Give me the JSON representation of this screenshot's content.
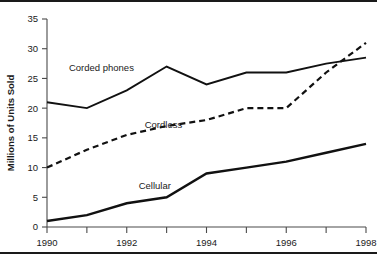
{
  "chart_data": {
    "type": "line",
    "title": "",
    "xlabel": "",
    "ylabel": "Millions of Units Sold",
    "xlim": [
      1990,
      1998
    ],
    "ylim": [
      0,
      35
    ],
    "grid": false,
    "legend_position": "inline-labels",
    "x": [
      1990,
      1991,
      1992,
      1993,
      1994,
      1995,
      1996,
      1997,
      1998
    ],
    "xtick_labels": [
      "1990",
      "1992",
      "1994",
      "1996",
      "1998"
    ],
    "xtick_values": [
      1990,
      1992,
      1994,
      1996,
      1998
    ],
    "xtick_minor_values": [
      1991,
      1993,
      1995,
      1997
    ],
    "ytick_labels": [
      "0",
      "5",
      "10",
      "15",
      "20",
      "25",
      "30",
      "35"
    ],
    "ytick_values": [
      0,
      5,
      10,
      15,
      20,
      25,
      30,
      35
    ],
    "series": [
      {
        "name": "Corded phones",
        "style": "solid",
        "label_x": 1990.55,
        "label_y": 26.2,
        "values": [
          21,
          20,
          23,
          27,
          24,
          26,
          26,
          27.5,
          28.5
        ]
      },
      {
        "name": "Cordless",
        "style": "dashed",
        "label_x": 1992.45,
        "label_y": 16.6,
        "values": [
          10,
          13,
          15.5,
          17,
          18,
          20,
          20,
          26,
          31
        ]
      },
      {
        "name": "Cellular",
        "style": "solid",
        "label_x": 1992.3,
        "label_y": 6.4,
        "values": [
          1,
          2,
          4,
          5,
          9,
          10,
          11,
          12.5,
          14
        ]
      }
    ]
  },
  "colors": {
    "ink": "#111111",
    "axis": "#4a4a4a",
    "frame": "#1a1a1a",
    "background": "#ffffff"
  }
}
